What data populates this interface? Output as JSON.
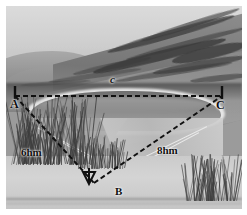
{
  "figure": {
    "kind": "geometry-diagram-over-photograph",
    "scene": "grayscale landscape watercolor: mountain ridge, lake basin, grassy foreground",
    "triangle": {
      "vertices": [
        {
          "id": "A",
          "label": "A",
          "x": 15,
          "y": 96
        },
        {
          "id": "B",
          "label": "B",
          "x": 94,
          "y": 183
        },
        {
          "id": "C",
          "label": "C",
          "x": 222,
          "y": 96
        }
      ],
      "sides": [
        {
          "id": "AC",
          "label": "c",
          "from": "A",
          "to": "C",
          "style": "dashed"
        },
        {
          "id": "AB",
          "label": "6hm",
          "from": "A",
          "to": "B",
          "style": "dashed"
        },
        {
          "id": "BC",
          "label": "8hm",
          "from": "B",
          "to": "C",
          "style": "dashed"
        }
      ],
      "right_angle_at": "B",
      "right_angle_marker": "arrow-marker"
    },
    "labels": {
      "vertex_a": "A",
      "vertex_b": "B",
      "vertex_c": "C",
      "side_c": "c",
      "side_ab": "6hm",
      "side_bc": "8hm"
    },
    "colors": {
      "line": "#101010",
      "label": "#101010",
      "frame": "#ffffff",
      "photo_tone": "#9a9a9a"
    },
    "line_style": {
      "dash": "5 3",
      "width": 2
    }
  }
}
